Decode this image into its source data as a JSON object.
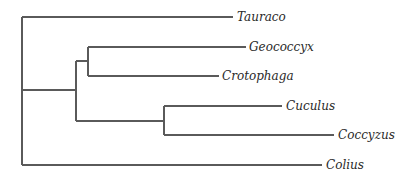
{
  "diagram": {
    "type": "phylogenetic-tree",
    "newick": "(Tauraco,((Geococcyx,Crotophaga),(Cuculus,Coccyzus)),Colius);",
    "taxa": [
      {
        "id": "tauraco",
        "label": "Tauraco"
      },
      {
        "id": "geococcyx",
        "label": "Geococcyx"
      },
      {
        "id": "crotophaga",
        "label": "Crotophaga"
      },
      {
        "id": "cuculus",
        "label": "Cuculus"
      },
      {
        "id": "coccyzus",
        "label": "Coccyzus"
      },
      {
        "id": "colius",
        "label": "Colius"
      }
    ],
    "line_color": "#5a5a5a",
    "text_color": "#2a2a2a"
  }
}
